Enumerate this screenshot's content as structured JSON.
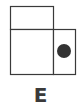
{
  "option": {
    "label": "E"
  },
  "figure": {
    "stroke_color": "#3a3a3a",
    "fill_color": "#ffffff",
    "dot_color": "#333333",
    "shapes": [
      {
        "name": "top-rect",
        "x": 10,
        "y": 6,
        "w": 43,
        "h": 23
      },
      {
        "name": "bottom-left-rect",
        "x": 10,
        "y": 29,
        "w": 43,
        "h": 45
      },
      {
        "name": "bottom-right-rect",
        "x": 53,
        "y": 29,
        "w": 22,
        "h": 45
      }
    ],
    "dot": {
      "cx": 64,
      "cy": 51,
      "r": 7
    }
  }
}
